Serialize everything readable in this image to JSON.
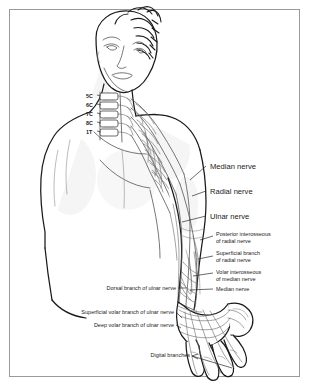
{
  "figure": {
    "border_color": "#9a9a9a",
    "background_color": "#ffffff",
    "outline_color": "#1a1a1a",
    "nerve_color": "#6b6b6b"
  },
  "spine_labels": [
    {
      "text": "5C",
      "x": 88,
      "y": 97
    },
    {
      "text": "6C",
      "x": 88,
      "y": 105
    },
    {
      "text": "7C",
      "x": 88,
      "y": 114
    },
    {
      "text": "8C",
      "x": 88,
      "y": 123
    },
    {
      "text": "1T",
      "x": 88,
      "y": 132
    }
  ],
  "labels_right_main": [
    {
      "text": "Median nerve",
      "x": 210,
      "y": 169
    },
    {
      "text": "Radial nerve",
      "x": 210,
      "y": 194
    },
    {
      "text": "Ulnar nerve",
      "x": 210,
      "y": 219
    }
  ],
  "labels_right_small": [
    {
      "line1": "Posterior interosseous",
      "line2": "of radial nerve",
      "x": 216,
      "y": 236
    },
    {
      "line1": "Superficial branch",
      "line2": "of radial nerve",
      "x": 216,
      "y": 255
    },
    {
      "line1": "Volar interosseous",
      "line2": "of median nerve",
      "x": 216,
      "y": 274
    },
    {
      "line1": "Median nerve",
      "line2": "",
      "x": 216,
      "y": 291
    }
  ],
  "labels_left_small": [
    {
      "text": "Dorsal branch of ulnar nerve",
      "x": 189,
      "y": 290
    },
    {
      "text": "Superficial volar branch of ulnar nerve",
      "x": 176,
      "y": 313
    },
    {
      "text": "Deep volar branch of ulnar nerve",
      "x": 176,
      "y": 326
    }
  ],
  "labels_bottom": [
    {
      "text": "Digital branches",
      "x": 186,
      "y": 355
    }
  ]
}
